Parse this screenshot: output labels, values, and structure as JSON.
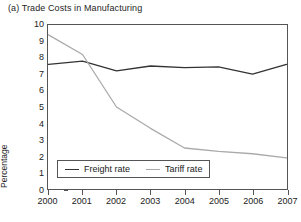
{
  "chart_data": {
    "type": "line",
    "title": "(a) Trade Costs in Manufacturing",
    "xlabel": "",
    "ylabel": "Percentage",
    "x": [
      "2000",
      "2001",
      "2002",
      "2003",
      "2004",
      "2005",
      "2006",
      "2007"
    ],
    "categories": [
      "2000",
      "2001",
      "2002",
      "2003",
      "2004",
      "2005",
      "2006",
      "2007"
    ],
    "ylim": [
      0,
      10
    ],
    "yticks": [
      0,
      1,
      2,
      3,
      4,
      5,
      6,
      7,
      8,
      9,
      10
    ],
    "ytick_labels": [
      "0",
      "1",
      "2",
      "3",
      "4",
      "5",
      "6",
      "7",
      "8",
      "9",
      "10"
    ],
    "grid": false,
    "legend_position": "lower-left-inside",
    "series": [
      {
        "name": "Freight rate",
        "color": "#333333",
        "values": [
          7.6,
          7.8,
          7.2,
          7.5,
          7.4,
          7.45,
          7.0,
          7.6
        ]
      },
      {
        "name": "Tariff rate",
        "color": "#aaaaaa",
        "values": [
          9.4,
          8.2,
          5.0,
          3.7,
          2.5,
          2.3,
          2.15,
          1.9
        ]
      }
    ]
  },
  "legend": {
    "entries": [
      {
        "label": "Freight rate"
      },
      {
        "label": "Tariff rate"
      }
    ]
  }
}
